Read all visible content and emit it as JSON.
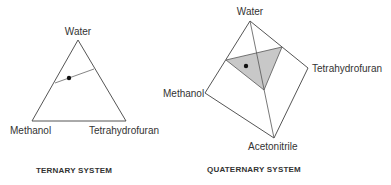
{
  "ternary": {
    "caption": "TERNARY SYSTEM",
    "vertices": {
      "top": "Water",
      "bottom_left": "Methanol",
      "bottom_right": "Tetrahydrofuran"
    }
  },
  "quaternary": {
    "caption": "QUATERNARY SYSTEM",
    "vertices": {
      "top": "Water",
      "left": "Methanol",
      "right": "Tetrahydrofuran",
      "bottom": "Acetonitrile"
    }
  },
  "colors": {
    "line": "#555555",
    "shade": "#c8c8c8",
    "dot": "#111111"
  }
}
